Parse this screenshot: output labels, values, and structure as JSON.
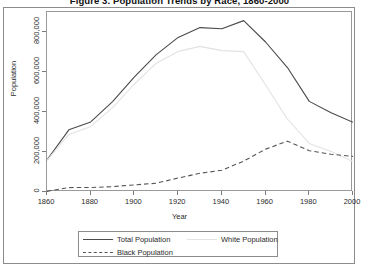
{
  "figure": {
    "title": "Figure 3. Population Trends by Race, 1860-2000"
  },
  "chart_data": {
    "type": "line",
    "title": "Figure 3. Population Trends by Race, 1860-2000",
    "xlabel": "Year",
    "ylabel": "Population",
    "xlim": [
      1860,
      2000
    ],
    "ylim": [
      0,
      900000
    ],
    "grid": false,
    "legend_position": "below-plot",
    "x": [
      1860,
      1870,
      1880,
      1890,
      1900,
      1910,
      1920,
      1930,
      1940,
      1950,
      1960,
      1970,
      1980,
      1990,
      2000
    ],
    "xticks": [
      1860,
      1880,
      1900,
      1920,
      1940,
      1960,
      1980,
      2000
    ],
    "xticklabels": [
      "1860",
      "1880",
      "1900",
      "1920",
      "1940",
      "1960",
      "1980",
      "2000"
    ],
    "yticks": [
      0,
      200000,
      400000,
      600000,
      800000
    ],
    "yticklabels": [
      "0",
      "200,000",
      "400,000",
      "600,000",
      "800,000"
    ],
    "series": [
      {
        "name": "Total Population",
        "style": "solid",
        "color": "#4a4a4a",
        "values": [
          160773,
          310864,
          350518,
          451770,
          575238,
          687029,
          772897,
          821960,
          816048,
          856796,
          750026,
          622236,
          453085,
          396685,
          348189
        ]
      },
      {
        "name": "White Population",
        "style": "solid",
        "color": "#e2e2e2",
        "values": [
          158000,
          288000,
          328000,
          422000,
          540000,
          644000,
          703000,
          728000,
          707000,
          702000,
          535000,
          365000,
          243000,
          203000,
          152000
        ]
      },
      {
        "name": "Black Population",
        "style": "dashed",
        "color": "#555555",
        "values": [
          3297,
          22088,
          22256,
          26865,
          35516,
          43960,
          69854,
          93580,
          108765,
          154448,
          214377,
          254191,
          206386,
          188408,
          178266
        ]
      }
    ]
  },
  "legend": {
    "items": [
      {
        "label": "Total Population",
        "style": "solid",
        "color": "#4a4a4a"
      },
      {
        "label": "White Population",
        "style": "solid",
        "color": "#e2e2e2"
      },
      {
        "label": "Black Population",
        "style": "dashed",
        "color": "#555555"
      }
    ]
  }
}
